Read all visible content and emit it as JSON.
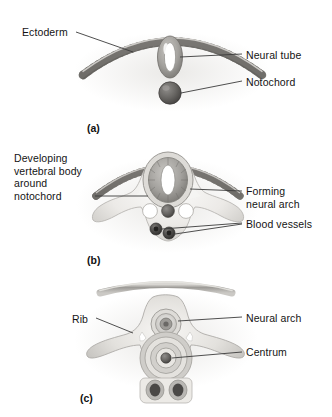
{
  "figure": {
    "background_color": "#ffffff",
    "ink_color": "#141414"
  },
  "panels": [
    {
      "id": "a",
      "caption": "(a)",
      "labels": [
        {
          "name": "ectoderm",
          "text": "Ectoderm"
        },
        {
          "name": "neural-tube",
          "text": "Neural tube"
        },
        {
          "name": "notochord",
          "text": "Notochord"
        }
      ]
    },
    {
      "id": "b",
      "caption": "(b)",
      "labels": [
        {
          "name": "developing-vertebral-body",
          "text": "Developing\nvertebral body\naround\nnotochord"
        },
        {
          "name": "forming-neural-arch",
          "text": "Forming\nneural arch"
        },
        {
          "name": "blood-vessels",
          "text": "Blood vessels"
        }
      ]
    },
    {
      "id": "c",
      "caption": "(c)",
      "labels": [
        {
          "name": "rib",
          "text": "Rib"
        },
        {
          "name": "neural-arch",
          "text": "Neural arch"
        },
        {
          "name": "centrum",
          "text": "Centrum"
        }
      ]
    }
  ],
  "labels": {
    "ectoderm": "Ectoderm",
    "neural_tube": "Neural tube",
    "notochord": "Notochord",
    "developing_vertebral_body": "Developing\nvertebral body\naround\nnotochord",
    "forming_neural_arch": "Forming\nneural arch",
    "blood_vessels": "Blood vessels",
    "rib": "Rib",
    "neural_arch": "Neural arch",
    "centrum": "Centrum"
  },
  "captions": {
    "a": "(a)",
    "b": "(b)",
    "c": "(c)"
  },
  "colors": {
    "leader_line": "#3b3b3b",
    "tissue_pale": "#f2f1ef",
    "tissue_mid": "#c9c7c4",
    "tissue_dark": "#8e8c89",
    "notochord": "#5d5b59",
    "vessel": "#464442",
    "lumen_white": "#ffffff"
  }
}
